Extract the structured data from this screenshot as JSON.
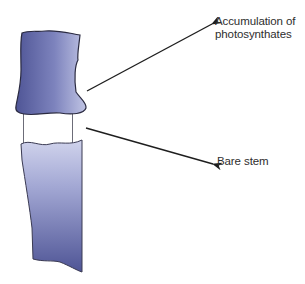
{
  "figure": {
    "colors": {
      "stem_dark": "#4f5596",
      "stem_light": "#c4c8e6",
      "outline": "#2a2a40",
      "arrow": "#1e1e1e",
      "label_text": "#2e2e2e",
      "background": "#ffffff"
    }
  },
  "labels": {
    "accumulation": {
      "line1": "Accumulation of",
      "line2": "photosynthates"
    },
    "bare_stem": "Bare stem"
  },
  "parts": [
    {
      "name": "upper-stem",
      "description": "swollen stem section above girdle"
    },
    {
      "name": "bare-stem-ring",
      "description": "girdled section with bark removed"
    },
    {
      "name": "lower-stem",
      "description": "stem section below girdle"
    }
  ],
  "arrows": [
    {
      "from_label": "Accumulation of photosynthates",
      "to_part": "upper-stem"
    },
    {
      "from_label": "Bare stem",
      "to_part": "bare-stem-ring"
    }
  ]
}
